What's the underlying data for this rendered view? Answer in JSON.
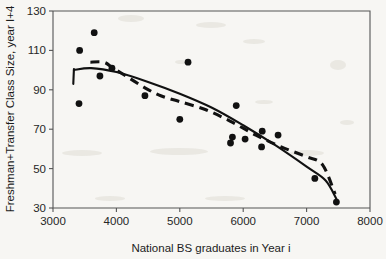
{
  "chart_data": {
    "type": "scatter",
    "title": "",
    "xlabel": "National BS graduates in Year i",
    "ylabel": "Freshman+Transfer Class Size, year I+4",
    "xlim": [
      3000,
      8000
    ],
    "ylim": [
      30,
      130
    ],
    "xticks": [
      3000,
      4000,
      5000,
      6000,
      7000,
      8000
    ],
    "yticks": [
      30,
      50,
      70,
      90,
      110,
      130
    ],
    "xtick_labels": [
      "3000",
      "4000",
      "5000",
      "6000",
      "7000",
      "8000"
    ],
    "ytick_labels": [
      "30",
      "50",
      "70",
      "90",
      "110",
      "130"
    ],
    "grid": false,
    "legend": false,
    "marker_color": "#111111",
    "points": [
      {
        "x": 3420,
        "y": 110
      },
      {
        "x": 3650,
        "y": 119
      },
      {
        "x": 3410,
        "y": 83
      },
      {
        "x": 3740,
        "y": 97
      },
      {
        "x": 3930,
        "y": 101
      },
      {
        "x": 4450,
        "y": 87
      },
      {
        "x": 5000,
        "y": 75
      },
      {
        "x": 5130,
        "y": 104
      },
      {
        "x": 5800,
        "y": 63
      },
      {
        "x": 5830,
        "y": 66
      },
      {
        "x": 5890,
        "y": 82
      },
      {
        "x": 6030,
        "y": 65
      },
      {
        "x": 6290,
        "y": 61
      },
      {
        "x": 6300,
        "y": 69
      },
      {
        "x": 6550,
        "y": 67
      },
      {
        "x": 7130,
        "y": 45
      },
      {
        "x": 7470,
        "y": 33
      }
    ],
    "series": [
      {
        "name": "polynomial-trend-solid",
        "style": "solid",
        "points": [
          {
            "x": 3330,
            "y": 100
          },
          {
            "x": 3600,
            "y": 101
          },
          {
            "x": 4000,
            "y": 99
          },
          {
            "x": 4500,
            "y": 94
          },
          {
            "x": 5000,
            "y": 88
          },
          {
            "x": 5500,
            "y": 81
          },
          {
            "x": 6000,
            "y": 72
          },
          {
            "x": 6500,
            "y": 62
          },
          {
            "x": 7000,
            "y": 51
          },
          {
            "x": 7300,
            "y": 44
          },
          {
            "x": 7480,
            "y": 34
          }
        ]
      },
      {
        "name": "moving-average-trend-dashed",
        "style": "dashed",
        "points": [
          {
            "x": 3590,
            "y": 104
          },
          {
            "x": 3800,
            "y": 104
          },
          {
            "x": 3950,
            "y": 101
          },
          {
            "x": 4200,
            "y": 96
          },
          {
            "x": 4450,
            "y": 91
          },
          {
            "x": 4700,
            "y": 87
          },
          {
            "x": 5000,
            "y": 84
          },
          {
            "x": 5400,
            "y": 80
          },
          {
            "x": 5800,
            "y": 74
          },
          {
            "x": 6200,
            "y": 67
          },
          {
            "x": 6600,
            "y": 61
          },
          {
            "x": 7000,
            "y": 56
          },
          {
            "x": 7250,
            "y": 52
          },
          {
            "x": 7450,
            "y": 37
          }
        ]
      }
    ]
  }
}
